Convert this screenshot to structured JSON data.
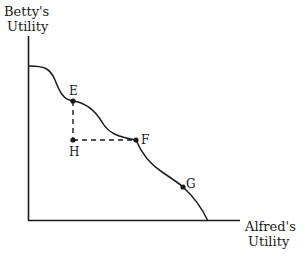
{
  "diagram": {
    "y_axis_label": [
      "Betty's",
      "Utility"
    ],
    "x_axis_label": [
      "Alfred's",
      "Utility"
    ],
    "points": {
      "E": "E",
      "F": "F",
      "G": "G",
      "H": "H"
    },
    "colors": {
      "line": "#1a1a1a",
      "background": "#ffffff"
    }
  }
}
